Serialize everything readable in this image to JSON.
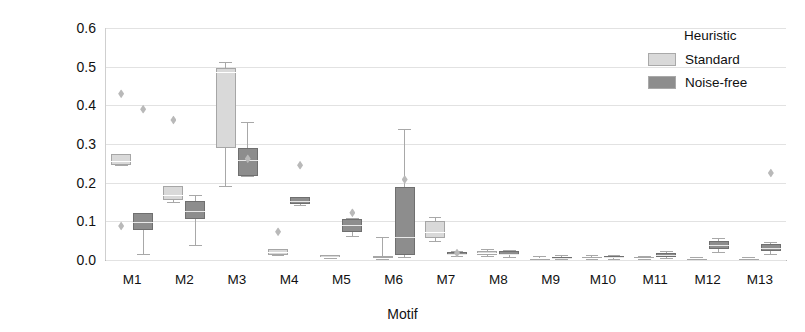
{
  "chart_data": {
    "type": "box",
    "title": "",
    "xlabel": "Motif",
    "ylabel": "Occurrence",
    "ylim": [
      0.0,
      0.6
    ],
    "yticks": [
      0.0,
      0.1,
      0.2,
      0.3,
      0.4,
      0.5,
      0.6
    ],
    "ytick_labels": [
      "0.0",
      "0.1",
      "0.2",
      "0.3",
      "0.4",
      "0.5",
      "0.6"
    ],
    "grid": true,
    "categories": [
      "M1",
      "M2",
      "M3",
      "M4",
      "M5",
      "M6",
      "M7",
      "M8",
      "M9",
      "M10",
      "M11",
      "M12",
      "M13"
    ],
    "legend": {
      "title": "Heuristic",
      "position": "top-right",
      "entries": [
        {
          "name": "Standard",
          "color": "#d9d9d9"
        },
        {
          "name": "Noise-free",
          "color": "#8d8d8d"
        }
      ]
    },
    "series": [
      {
        "name": "Standard",
        "color": "#d9d9d9",
        "boxes": [
          {
            "category": "M1",
            "whisker_low": 0.245,
            "q1": 0.245,
            "median": 0.255,
            "q3": 0.275,
            "whisker_high": 0.275,
            "outliers": [
              0.43,
              0.088
            ]
          },
          {
            "category": "M2",
            "whisker_low": 0.15,
            "q1": 0.155,
            "median": 0.168,
            "q3": 0.192,
            "whisker_high": 0.192,
            "outliers": [
              0.362
            ]
          },
          {
            "category": "M3",
            "whisker_low": 0.192,
            "q1": 0.29,
            "median": 0.485,
            "q3": 0.497,
            "whisker_high": 0.512,
            "outliers": []
          },
          {
            "category": "M4",
            "whisker_low": 0.012,
            "q1": 0.012,
            "median": 0.02,
            "q3": 0.028,
            "whisker_high": 0.028,
            "outliers": [
              0.073
            ]
          },
          {
            "category": "M5",
            "whisker_low": 0.005,
            "q1": 0.005,
            "median": 0.008,
            "q3": 0.012,
            "whisker_high": 0.012,
            "outliers": []
          },
          {
            "category": "M6",
            "whisker_low": 0.002,
            "q1": 0.004,
            "median": 0.006,
            "q3": 0.01,
            "whisker_high": 0.06,
            "outliers": []
          },
          {
            "category": "M7",
            "whisker_low": 0.048,
            "q1": 0.058,
            "median": 0.072,
            "q3": 0.1,
            "whisker_high": 0.112,
            "outliers": []
          },
          {
            "category": "M8",
            "whisker_low": 0.01,
            "q1": 0.014,
            "median": 0.018,
            "q3": 0.024,
            "whisker_high": 0.028,
            "outliers": []
          },
          {
            "category": "M9",
            "whisker_low": 0.002,
            "q1": 0.003,
            "median": 0.004,
            "q3": 0.006,
            "whisker_high": 0.01,
            "outliers": []
          },
          {
            "category": "M10",
            "whisker_low": 0.002,
            "q1": 0.004,
            "median": 0.006,
            "q3": 0.009,
            "whisker_high": 0.013,
            "outliers": []
          },
          {
            "category": "M11",
            "whisker_low": 0.002,
            "q1": 0.003,
            "median": 0.005,
            "q3": 0.008,
            "whisker_high": 0.01,
            "outliers": []
          },
          {
            "category": "M12",
            "whisker_low": 0.002,
            "q1": 0.003,
            "median": 0.004,
            "q3": 0.006,
            "whisker_high": 0.008,
            "outliers": []
          },
          {
            "category": "M13",
            "whisker_low": 0.002,
            "q1": 0.003,
            "median": 0.004,
            "q3": 0.006,
            "whisker_high": 0.008,
            "outliers": []
          }
        ]
      },
      {
        "name": "Noise-free",
        "color": "#8d8d8d",
        "boxes": [
          {
            "category": "M1",
            "whisker_low": 0.016,
            "q1": 0.078,
            "median": 0.098,
            "q3": 0.122,
            "whisker_high": 0.122,
            "outliers": [
              0.39
            ]
          },
          {
            "category": "M2",
            "whisker_low": 0.038,
            "q1": 0.105,
            "median": 0.128,
            "q3": 0.152,
            "whisker_high": 0.168,
            "outliers": []
          },
          {
            "category": "M3",
            "whisker_low": 0.218,
            "q1": 0.218,
            "median": 0.258,
            "q3": 0.29,
            "whisker_high": 0.358,
            "outliers": [
              0.262
            ]
          },
          {
            "category": "M4",
            "whisker_low": 0.142,
            "q1": 0.145,
            "median": 0.152,
            "q3": 0.162,
            "whisker_high": 0.162,
            "outliers": [
              0.245
            ]
          },
          {
            "category": "M5",
            "whisker_low": 0.062,
            "q1": 0.072,
            "median": 0.09,
            "q3": 0.105,
            "whisker_high": 0.108,
            "outliers": [
              0.122
            ]
          },
          {
            "category": "M6",
            "whisker_low": 0.008,
            "q1": 0.012,
            "median": 0.06,
            "q3": 0.19,
            "whisker_high": 0.34,
            "outliers": [
              0.208
            ]
          },
          {
            "category": "M7",
            "whisker_low": 0.01,
            "q1": 0.013,
            "median": 0.016,
            "q3": 0.02,
            "whisker_high": 0.024,
            "outliers": [
              0.018
            ]
          },
          {
            "category": "M8",
            "whisker_low": 0.008,
            "q1": 0.012,
            "median": 0.016,
            "q3": 0.022,
            "whisker_high": 0.026,
            "outliers": []
          },
          {
            "category": "M9",
            "whisker_low": 0.002,
            "q1": 0.004,
            "median": 0.006,
            "q3": 0.009,
            "whisker_high": 0.012,
            "outliers": []
          },
          {
            "category": "M10",
            "whisker_low": 0.002,
            "q1": 0.005,
            "median": 0.008,
            "q3": 0.011,
            "whisker_high": 0.014,
            "outliers": []
          },
          {
            "category": "M11",
            "whisker_low": 0.004,
            "q1": 0.008,
            "median": 0.012,
            "q3": 0.018,
            "whisker_high": 0.022,
            "outliers": []
          },
          {
            "category": "M12",
            "whisker_low": 0.02,
            "q1": 0.028,
            "median": 0.038,
            "q3": 0.05,
            "whisker_high": 0.056,
            "outliers": []
          },
          {
            "category": "M13",
            "whisker_low": 0.016,
            "q1": 0.022,
            "median": 0.03,
            "q3": 0.042,
            "whisker_high": 0.046,
            "outliers": [
              0.225
            ]
          }
        ]
      }
    ]
  }
}
